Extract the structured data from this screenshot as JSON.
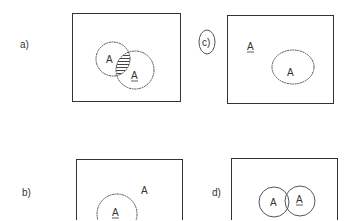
{
  "diagrams": {
    "a": {
      "label": "a)",
      "left_set": "A",
      "right_set": "A",
      "right_set_complement": true,
      "shaded_region": "intersection"
    },
    "b": {
      "label": "b)",
      "inside_set": "A",
      "inside_set_complement": true,
      "outside_set": "A"
    },
    "c": {
      "label": "c)",
      "label_circled": true,
      "outside_set": "A",
      "outside_set_complement": true,
      "inside_set": "A"
    },
    "d": {
      "label": "d)",
      "left_set": "A",
      "right_set": "A",
      "right_set_complement": true
    }
  },
  "colors": {
    "line": "#333333",
    "hatch": "#444444",
    "background": "#ffffff"
  }
}
